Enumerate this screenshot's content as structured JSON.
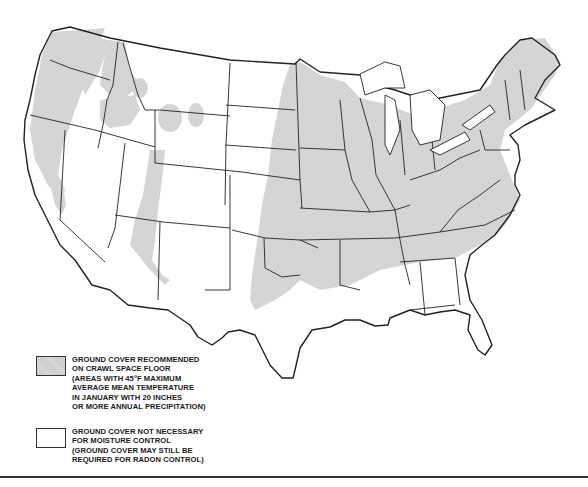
{
  "map": {
    "subject": "Contiguous United States",
    "colors": {
      "shaded_fill": "#d4d4d4",
      "state_outline": "#222222",
      "background": "#ffffff"
    }
  },
  "legend": {
    "items": [
      {
        "swatch": "shaded",
        "lines": [
          "GROUND COVER RECOMMENDED",
          "ON CRAWL SPACE FLOOR",
          "(AREAS WITH 45°F MAXIMUM",
          "AVERAGE MEAN TEMPERATURE",
          "IN JANUARY WITH 20 INCHES",
          "OR MORE ANNUAL PRECIPITATION)"
        ]
      },
      {
        "swatch": "clear",
        "lines": [
          "GROUND COVER NOT NECESSARY",
          "FOR MOISTURE CONTROL",
          "(GROUND COVER MAY STILL BE",
          "REQUIRED FOR RADON CONTROL)"
        ]
      }
    ]
  }
}
